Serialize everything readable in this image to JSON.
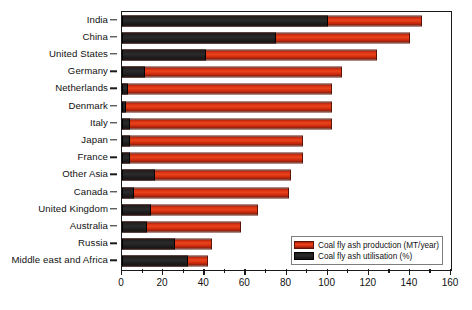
{
  "chart_data": {
    "type": "bar",
    "orientation": "horizontal",
    "stacked": true,
    "title": "",
    "xlabel": "",
    "ylabel": "",
    "xlim": [
      0,
      160
    ],
    "xticks": [
      0,
      20,
      40,
      60,
      80,
      100,
      120,
      140,
      160
    ],
    "xtick_labels": [
      "0",
      "20",
      "40",
      "60",
      "80",
      "100",
      "120",
      "140",
      "160"
    ],
    "minor_tick_step": 10,
    "grid": false,
    "legend_position": "bottom-right",
    "categories": [
      "India",
      "China",
      "United States",
      "Germany",
      "Netherlands",
      "Denmark",
      "Italy",
      "Japan",
      "France",
      "Other Asia",
      "Canada",
      "United Kingdom",
      "Australia",
      "Russia",
      "Middle east and Africa"
    ],
    "series": [
      {
        "name": "Coal fly ash utilisation (%)",
        "color": "#1d1d1d",
        "values": [
          100,
          75,
          41,
          11,
          3,
          2,
          4,
          4,
          4,
          16,
          6,
          14,
          12,
          26,
          32
        ]
      },
      {
        "name": "Coal fly ash production (MT/year)",
        "color": "#d6300f",
        "values": [
          146,
          140,
          124,
          107,
          102,
          102,
          102,
          88,
          88,
          82,
          81,
          66,
          58,
          44,
          42
        ]
      }
    ],
    "legend_entries": [
      {
        "label": "Coal fly ash production (MT/year)",
        "color": "#d6300f"
      },
      {
        "label": "Coal fly ash utilisation (%)",
        "color": "#1d1d1d"
      }
    ]
  },
  "caption": ""
}
